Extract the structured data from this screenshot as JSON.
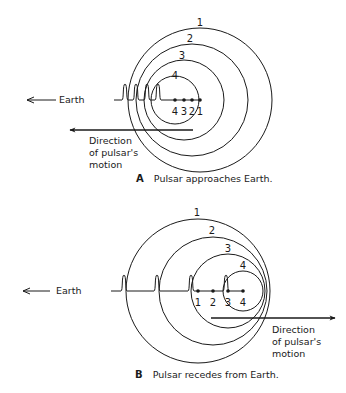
{
  "colors": {
    "ink": "#1a1a1a",
    "background": "#ffffff"
  },
  "panels": [
    {
      "id": "A",
      "letter": "A",
      "caption": "Pulsar approaches Earth.",
      "caption_pos": [
        136,
        182
      ],
      "earth_label": "Earth",
      "earth_arrow": {
        "x1": 56,
        "x2": 27,
        "y": 100,
        "text_x": 59,
        "text_y": 103
      },
      "baseline": {
        "x1": 114,
        "x2": 200,
        "y": 100
      },
      "pulses_x": [
        125,
        136,
        147,
        158
      ],
      "pulse_height": 16,
      "circles": [
        {
          "label": "1",
          "cx": 200,
          "cy": 100,
          "r": 72,
          "label_x": 200,
          "label_y": 26
        },
        {
          "label": "2",
          "cx": 192,
          "cy": 100,
          "r": 56,
          "label_x": 190,
          "label_y": 42
        },
        {
          "label": "3",
          "cx": 184,
          "cy": 100,
          "r": 40,
          "label_x": 182,
          "label_y": 59
        },
        {
          "label": "4",
          "cx": 175,
          "cy": 100,
          "r": 24,
          "label_x": 175,
          "label_y": 79
        }
      ],
      "positions": [
        {
          "label": "4",
          "x": 175
        },
        {
          "label": "3",
          "x": 184
        },
        {
          "label": "2",
          "x": 192
        },
        {
          "label": "1",
          "x": 200
        }
      ],
      "positions_label_y": 115,
      "motion_arrow": {
        "x1": 193,
        "x2": 70,
        "y": 130
      },
      "motion_label": [
        "Direction",
        "of pulsar's",
        "motion"
      ],
      "motion_label_pos": [
        89,
        144
      ]
    },
    {
      "id": "B",
      "letter": "B",
      "caption": "Pulsar recedes from Earth.",
      "caption_pos": [
        135,
        378
      ],
      "earth_label": "Earth",
      "earth_arrow": {
        "x1": 50,
        "x2": 23,
        "y": 291,
        "text_x": 56,
        "text_y": 294
      },
      "baseline": {
        "x1": 111,
        "x2": 243,
        "y": 291
      },
      "pulses_x": [
        124,
        157,
        191,
        226
      ],
      "pulse_height": 16,
      "circles": [
        {
          "label": "1",
          "cx": 198,
          "cy": 291,
          "r": 72,
          "label_x": 197,
          "label_y": 216
        },
        {
          "label": "2",
          "cx": 213,
          "cy": 291,
          "r": 54,
          "label_x": 212,
          "label_y": 234
        },
        {
          "label": "3",
          "cx": 228,
          "cy": 291,
          "r": 37,
          "label_x": 228,
          "label_y": 252
        },
        {
          "label": "4",
          "cx": 243,
          "cy": 291,
          "r": 20,
          "label_x": 243,
          "label_y": 269
        }
      ],
      "positions": [
        {
          "label": "1",
          "x": 198
        },
        {
          "label": "2",
          "x": 213
        },
        {
          "label": "3",
          "x": 228
        },
        {
          "label": "4",
          "x": 243
        }
      ],
      "positions_label_y": 306,
      "motion_arrow": {
        "x1": 211,
        "x2": 335,
        "y": 318
      },
      "motion_label": [
        "Direction",
        "of pulsar's",
        "motion"
      ],
      "motion_label_pos": [
        272,
        333
      ]
    }
  ]
}
